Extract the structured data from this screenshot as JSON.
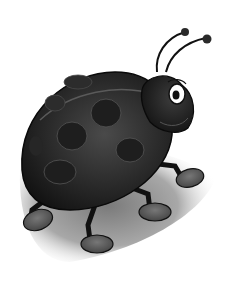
{
  "image": {
    "subject": "cartoon ladybug",
    "style": "grayscale illustration",
    "colors": {
      "background": "#ffffff",
      "shell_dark": "#141414",
      "shell_mid": "#3a3a3a",
      "shell_highlight": "#6a6a6a",
      "spot": "#2a2a2a",
      "shadow": "#9a9a9a",
      "foot": "#5a5a5a",
      "eye_white": "#ffffff",
      "pupil": "#111111"
    }
  }
}
